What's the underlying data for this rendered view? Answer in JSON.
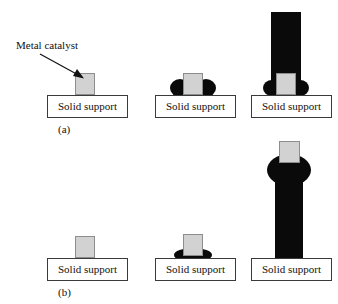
{
  "figure": {
    "background_color": "#ffffff",
    "width": 338,
    "height": 304
  },
  "colors": {
    "catalyst_fill": "#d2d2d2",
    "catalyst_border": "#8d8d8d",
    "carbon_black": "#0a0a0a",
    "box_border": "#3a3a3a",
    "text": "#111111",
    "page": "#ffffff"
  },
  "annotations": {
    "metal_catalyst_label": "Metal catalyst",
    "arrow_icon": "arrow-pointing-down-right"
  },
  "rows": [
    {
      "id": "a",
      "caption": "(a)",
      "mechanism": "base growth",
      "panels": [
        {
          "id": "a1",
          "stage": 1,
          "support_label": "Solid support",
          "has_catalyst": true,
          "has_carbon": false,
          "catalyst_position": "on-support"
        },
        {
          "id": "a2",
          "stage": 2,
          "support_label": "Solid support",
          "has_catalyst": true,
          "has_carbon": true,
          "catalyst_position": "on-support"
        },
        {
          "id": "a3",
          "stage": 3,
          "support_label": "Solid support",
          "has_catalyst": true,
          "has_carbon": true,
          "catalyst_position": "base-of-tube"
        }
      ]
    },
    {
      "id": "b",
      "caption": "(b)",
      "mechanism": "tip growth",
      "panels": [
        {
          "id": "b1",
          "stage": 1,
          "support_label": "Solid support",
          "has_catalyst": true,
          "has_carbon": false,
          "catalyst_position": "on-support"
        },
        {
          "id": "b2",
          "stage": 2,
          "support_label": "Solid support",
          "has_catalyst": true,
          "has_carbon": true,
          "catalyst_position": "on-carbon-mound"
        },
        {
          "id": "b3",
          "stage": 3,
          "support_label": "Solid support",
          "has_catalyst": true,
          "has_carbon": true,
          "catalyst_position": "tip-of-tube"
        }
      ]
    }
  ]
}
